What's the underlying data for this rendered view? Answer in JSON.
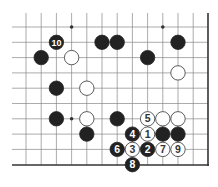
{
  "board": {
    "grid": {
      "x0": 26,
      "y0": 27,
      "dx": 15.2,
      "dy": 15.3,
      "cols": 12,
      "rows": 10,
      "right_edge_x": 208,
      "bottom_edge_y": 165,
      "top_open": true,
      "left_open": true,
      "line_color": "#888888",
      "edge_color": "#333333"
    },
    "star_points": [
      [
        3,
        0
      ],
      [
        9,
        0
      ],
      [
        3,
        6
      ]
    ],
    "stones": [
      {
        "color": "black",
        "col": 2,
        "row": 1,
        "label": "10"
      },
      {
        "color": "black",
        "col": 5,
        "row": 1,
        "label": ""
      },
      {
        "color": "black",
        "col": 6,
        "row": 1,
        "label": ""
      },
      {
        "color": "black",
        "col": 10,
        "row": 1,
        "label": ""
      },
      {
        "color": "black",
        "col": 1,
        "row": 2,
        "label": ""
      },
      {
        "color": "white",
        "col": 3,
        "row": 2,
        "label": ""
      },
      {
        "color": "black",
        "col": 8,
        "row": 2,
        "label": ""
      },
      {
        "color": "white",
        "col": 10,
        "row": 3,
        "label": ""
      },
      {
        "color": "black",
        "col": 2,
        "row": 4,
        "label": ""
      },
      {
        "color": "white",
        "col": 4,
        "row": 4,
        "label": ""
      },
      {
        "color": "black",
        "col": 2,
        "row": 6,
        "label": ""
      },
      {
        "color": "white",
        "col": 4,
        "row": 6,
        "label": ""
      },
      {
        "color": "black",
        "col": 4,
        "row": 7,
        "label": ""
      },
      {
        "color": "black",
        "col": 6,
        "row": 6,
        "label": ""
      },
      {
        "color": "white",
        "col": 8,
        "row": 6,
        "label": "5"
      },
      {
        "color": "white",
        "col": 9,
        "row": 6,
        "label": ""
      },
      {
        "color": "white",
        "col": 10,
        "row": 6,
        "label": ""
      },
      {
        "color": "black",
        "col": 7,
        "row": 7,
        "label": "4"
      },
      {
        "color": "white",
        "col": 8,
        "row": 7,
        "label": "1"
      },
      {
        "color": "black",
        "col": 9,
        "row": 7,
        "label": ""
      },
      {
        "color": "black",
        "col": 10,
        "row": 7,
        "label": ""
      },
      {
        "color": "black",
        "col": 6,
        "row": 8,
        "label": "6"
      },
      {
        "color": "white",
        "col": 7,
        "row": 8,
        "label": "3"
      },
      {
        "color": "black",
        "col": 8,
        "row": 8,
        "label": "2"
      },
      {
        "color": "white",
        "col": 9,
        "row": 8,
        "label": "7"
      },
      {
        "color": "white",
        "col": 10,
        "row": 8,
        "label": "9"
      },
      {
        "color": "black",
        "col": 7,
        "row": 9,
        "label": "8"
      }
    ],
    "colors": {
      "black_stone": "#222222",
      "white_stone": "#ffffff",
      "white_stroke": "#333333",
      "black_label": "#ffffff",
      "white_label": "#333333"
    }
  }
}
